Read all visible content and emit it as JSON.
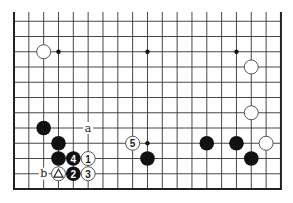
{
  "diagram": {
    "type": "go-board-fragment",
    "board": {
      "columns": 19,
      "rows_visible": 12,
      "open_top": true,
      "origin_x": 14,
      "origin_y": 189,
      "col_spacing": 14.83,
      "row_spacing": 15.25,
      "top_extension_y": 12,
      "line_color": "#333333",
      "background": "#ffffff"
    },
    "star_points": [
      {
        "col": 3,
        "line": 10
      },
      {
        "col": 9,
        "line": 10
      },
      {
        "col": 15,
        "line": 10
      },
      {
        "col": 9,
        "line": 4
      }
    ],
    "stones": [
      {
        "color": "white",
        "col": 2,
        "line": 10,
        "label": ""
      },
      {
        "color": "white",
        "col": 16,
        "line": 9,
        "label": ""
      },
      {
        "color": "white",
        "col": 16,
        "line": 6,
        "label": ""
      },
      {
        "color": "white",
        "col": 17,
        "line": 4,
        "label": ""
      },
      {
        "color": "black",
        "col": 13,
        "line": 4,
        "label": ""
      },
      {
        "color": "black",
        "col": 15,
        "line": 4,
        "label": ""
      },
      {
        "color": "black",
        "col": 16,
        "line": 3,
        "label": ""
      },
      {
        "color": "black",
        "col": 9,
        "line": 3,
        "label": ""
      },
      {
        "color": "black",
        "col": 2,
        "line": 5,
        "label": ""
      },
      {
        "color": "black",
        "col": 3,
        "line": 4,
        "label": ""
      },
      {
        "color": "black",
        "col": 3,
        "line": 3,
        "label": ""
      },
      {
        "color": "black",
        "col": 4,
        "line": 3,
        "label": "4"
      },
      {
        "color": "white",
        "col": 5,
        "line": 3,
        "label": "1"
      },
      {
        "color": "white",
        "col": 3,
        "line": 2,
        "label": "",
        "marker": "triangle"
      },
      {
        "color": "black",
        "col": 4,
        "line": 2,
        "label": "2"
      },
      {
        "color": "white",
        "col": 5,
        "line": 2,
        "label": "3"
      },
      {
        "color": "white",
        "col": 8,
        "line": 4,
        "label": "5"
      }
    ],
    "point_labels": [
      {
        "text": "a",
        "col": 5,
        "line": 5
      },
      {
        "text": "b",
        "col": 2,
        "line": 2
      }
    ]
  }
}
